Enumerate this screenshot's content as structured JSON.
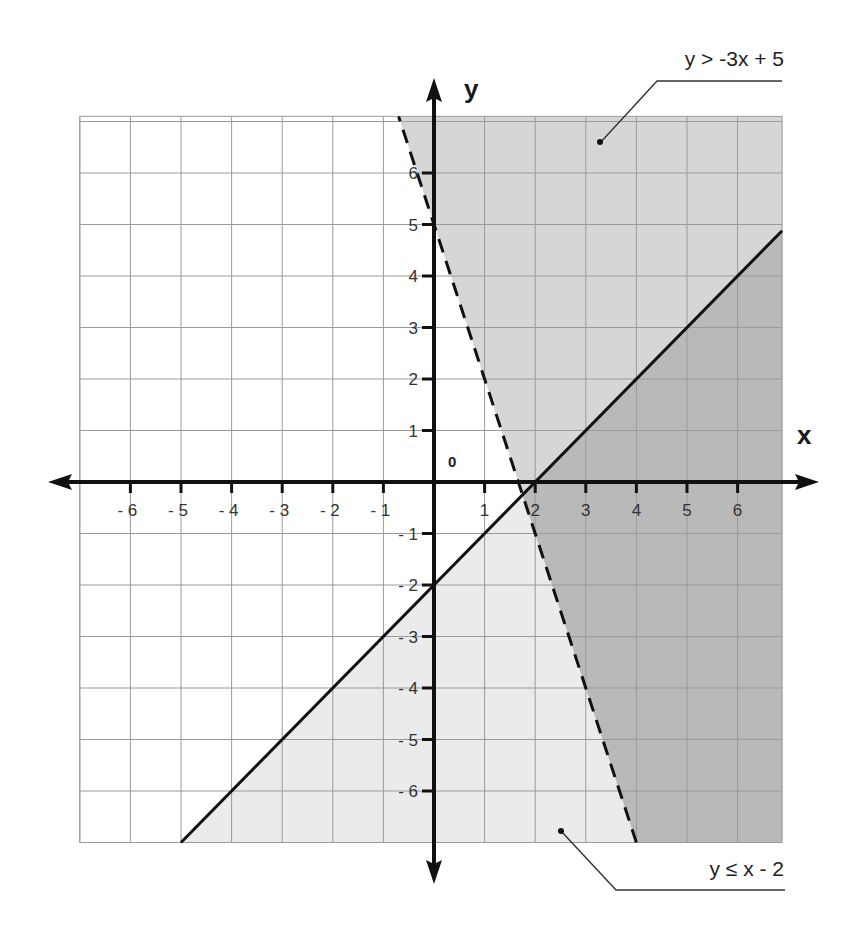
{
  "chart_data": {
    "type": "inequality-graph",
    "title": "",
    "xlabel": "x",
    "ylabel": "y",
    "origin_label": "0",
    "xlim": [
      -7,
      6.88
    ],
    "ylim": [
      -7,
      7.1
    ],
    "grid": true,
    "x_ticks": [
      -6,
      -5,
      -4,
      -3,
      -2,
      -1,
      1,
      2,
      3,
      4,
      5,
      6
    ],
    "x_tick_labels": [
      "- 6",
      "- 5",
      "- 4",
      "- 3",
      "- 2",
      "- 1",
      "1",
      "2",
      "3",
      "4",
      "5",
      "6"
    ],
    "y_ticks": [
      6,
      5,
      4,
      3,
      2,
      1,
      -1,
      -2,
      -3,
      -4,
      -5,
      -6
    ],
    "y_tick_labels": [
      "6",
      "5",
      "4",
      "3",
      "2",
      "1",
      "- 1",
      "- 2",
      "- 3",
      "- 4",
      "- 5",
      "- 6"
    ],
    "series": [
      {
        "name": "y > -3x + 5",
        "boundary": {
          "slope": -3,
          "intercept": 5,
          "style": "dashed"
        },
        "shade": "above",
        "annotation": "y > -3x + 5"
      },
      {
        "name": "y ≤ x - 2",
        "boundary": {
          "slope": 1,
          "intercept": -2,
          "style": "solid"
        },
        "shade": "below",
        "annotation": "y ≤ x - 2"
      }
    ],
    "intersection_region": "overlap shaded darkest",
    "colors": {
      "shade_a": "#d6d6d6",
      "shade_b": "#ebebeb",
      "overlap": "#b9b9b9",
      "grid": "#9a9a9a",
      "axis": "#111111"
    }
  },
  "labels": {
    "annotation_top": "y > -3x + 5",
    "annotation_bottom": "y ≤ x - 2",
    "x_axis": "x",
    "y_axis": "y",
    "origin": "0"
  }
}
